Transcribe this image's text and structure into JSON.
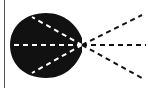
{
  "diagram": {
    "background": "#ffffff",
    "border_color": "#555555",
    "blob": {
      "fill": "#111111",
      "left": 10,
      "top": 13,
      "right": 82,
      "bottom": 78
    },
    "focal_point": {
      "x": 82,
      "y": 45
    },
    "dash_color_inside": "#ffffff",
    "dash_color_outside": "#111111",
    "rays_inside": [
      {
        "x2": 32,
        "y2": 17
      },
      {
        "x2": 10,
        "y2": 45
      },
      {
        "x2": 32,
        "y2": 73
      }
    ],
    "rays_outside": [
      {
        "x2": 142,
        "y2": 15
      },
      {
        "x2": 146,
        "y2": 45
      },
      {
        "x2": 142,
        "y2": 78
      }
    ]
  }
}
